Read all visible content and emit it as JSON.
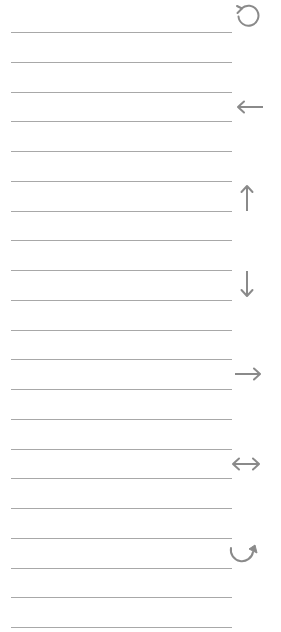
{
  "page": {
    "background": "#ffffff",
    "line_color": "#a8a8a8",
    "icon_color": "#8a8a8a"
  },
  "lines": {
    "count": 21,
    "start_y": 32,
    "spacing": 29.75,
    "left": 11,
    "width": 221
  },
  "icons": [
    {
      "name": "rotate-counterclockwise-icon",
      "glyph": "↺",
      "x": 247,
      "y": 15
    },
    {
      "name": "arrow-left-icon",
      "glyph": "←",
      "x": 250,
      "y": 107
    },
    {
      "name": "arrow-up-icon",
      "glyph": "↑",
      "x": 247,
      "y": 197
    },
    {
      "name": "arrow-down-icon",
      "glyph": "↓",
      "x": 247,
      "y": 284
    },
    {
      "name": "arrow-right-icon",
      "glyph": "→",
      "x": 248,
      "y": 374
    },
    {
      "name": "arrow-left-right-icon",
      "glyph": "↔",
      "x": 246,
      "y": 464
    },
    {
      "name": "curved-arrow-clockwise-icon",
      "glyph": "↷",
      "x": 245,
      "y": 553
    }
  ]
}
